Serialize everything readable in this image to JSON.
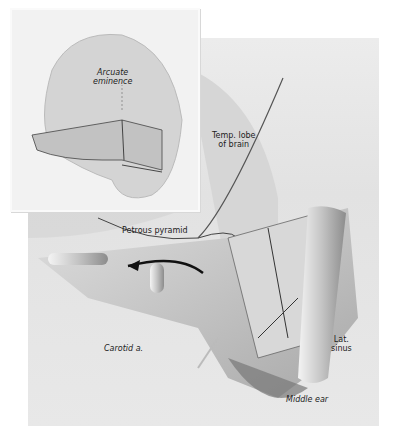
{
  "figure": {
    "inset": {
      "labels": {
        "arcuate": "Arcuate\neminence"
      }
    },
    "main": {
      "labels": {
        "temp_lobe": "Temp. lobe\nof brain",
        "petrous": "Petrous pyramid",
        "carotid": "Carotid a.",
        "lat_sinus": "Lat.\nsinus",
        "middle_ear": "Middle ear"
      }
    },
    "colors": {
      "background": "#ffffff",
      "panel": "#e6e6e6",
      "bone": "#c8c8c8",
      "shadow": "#8a8a8a",
      "ink": "#222222"
    }
  }
}
